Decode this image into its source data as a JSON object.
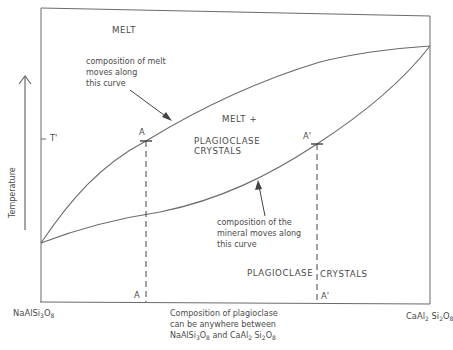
{
  "diagram": {
    "type": "binary-phase-diagram",
    "y_axis": {
      "label": "Temperature",
      "arrow": "up"
    },
    "tick_label": "T'",
    "regions": {
      "melt": "MELT",
      "melt_plus": "MELT +",
      "melt_plus_2": "PLAGIOCLASE",
      "melt_plus_3": "CRYSTALS",
      "solid_left": "PLAGIOCLASE",
      "solid_right": "CRYSTALS"
    },
    "annotations": {
      "liquidus_1": "composition of melt",
      "liquidus_2": "moves along",
      "liquidus_3": "this curve",
      "solidus_1": "composition of the",
      "solidus_2": "mineral moves along",
      "solidus_3": "this curve"
    },
    "points": {
      "a_top": "A",
      "a_bottom": "A",
      "a_prime_top": "A'",
      "a_prime_bottom": "A'"
    },
    "endmembers": {
      "left": {
        "base": "NaAlSi",
        "s1": "3",
        "mid": "O",
        "s2": "8"
      },
      "right": {
        "base1": "CaAl",
        "s1": "2",
        "base2": " Si",
        "s2": "2",
        "mid": "O",
        "s3": "8"
      }
    },
    "x_caption": {
      "line1": "Composition of plagioclase",
      "line2": "can be anywhere between",
      "line3_a": "NaAlSi",
      "line3_s1": "3",
      "line3_b": "O",
      "line3_s2": "8",
      "line3_c": " and CaAl",
      "line3_s3": "2",
      "line3_d": " Si",
      "line3_s4": "2",
      "line3_e": "O",
      "line3_s5": "8"
    },
    "colors": {
      "line": "#6a6a6a",
      "text": "#4a4a4a",
      "background": "#ffffff"
    }
  }
}
